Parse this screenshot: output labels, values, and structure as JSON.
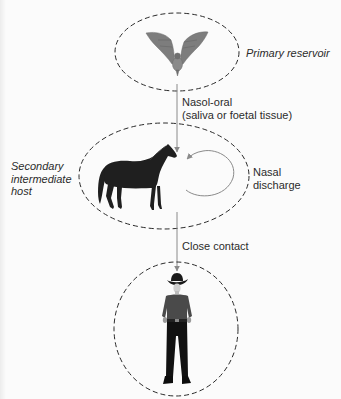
{
  "diagram": {
    "nodes": [
      {
        "id": "bat",
        "icon": "bat-icon",
        "label": "Primary reservoir"
      },
      {
        "id": "horse",
        "icon": "horse-icon",
        "label_lines": [
          "Secondary",
          "intermediate",
          "host"
        ]
      },
      {
        "id": "human",
        "icon": "person-icon",
        "label": ""
      }
    ],
    "edges": [
      {
        "from": "bat",
        "to": "horse",
        "label_lines": [
          "Nasol-oral",
          "(saliva or foetal tissue)"
        ]
      },
      {
        "from": "horse",
        "to": "horse",
        "label_lines": [
          "Nasal",
          "discharge"
        ]
      },
      {
        "from": "horse",
        "to": "human",
        "label": "Close contact"
      }
    ],
    "colors": {
      "ellipse_stroke": "#2a2a2a",
      "arrow": "#8a8a8a",
      "bat": "#7d7d7d",
      "horse": "#1f1f1f",
      "shirt": "#4a4a4a",
      "pants": "#111111"
    }
  }
}
